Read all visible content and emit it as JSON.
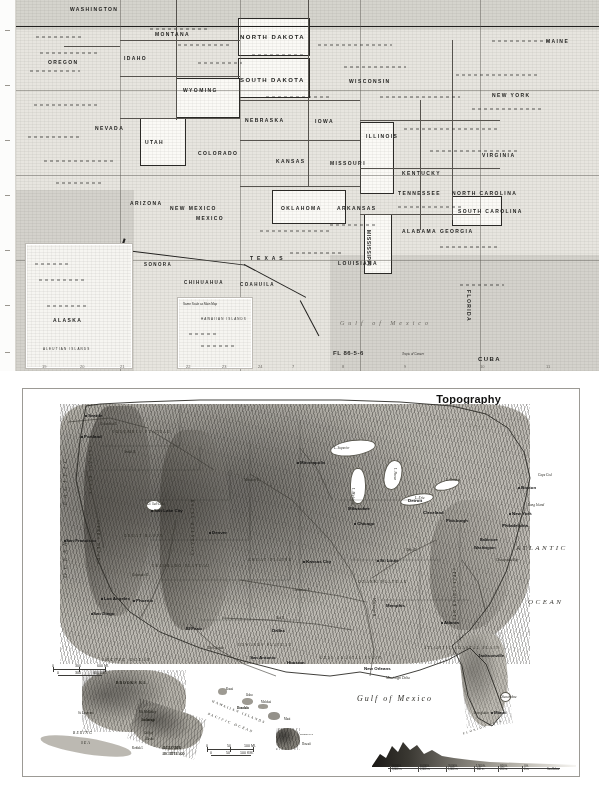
{
  "page": {
    "kind": "scanned-atlas-page",
    "background_color": "#ffffff"
  },
  "top_map": {
    "name": "united-states-reference-map",
    "plate_number": "FL 86-5-6",
    "paper_color": "#e7e5df",
    "states": [
      {
        "label": "WASHINGTON",
        "x": 70,
        "y": 6
      },
      {
        "label": "OREGON",
        "x": 48,
        "y": 59
      },
      {
        "label": "MONTANA",
        "x": 155,
        "y": 31
      },
      {
        "label": "NORTH DAKOTA",
        "x": 240,
        "y": 34
      },
      {
        "label": "SOUTH DAKOTA",
        "x": 240,
        "y": 77
      },
      {
        "label": "IDAHO",
        "x": 124,
        "y": 55
      },
      {
        "label": "WYOMING",
        "x": 183,
        "y": 87
      },
      {
        "label": "NEBRASKA",
        "x": 245,
        "y": 117
      },
      {
        "label": "NEVADA",
        "x": 95,
        "y": 125
      },
      {
        "label": "UTAH",
        "x": 145,
        "y": 139
      },
      {
        "label": "COLORADO",
        "x": 198,
        "y": 150
      },
      {
        "label": "KANSAS",
        "x": 276,
        "y": 158
      },
      {
        "label": "IOWA",
        "x": 315,
        "y": 118
      },
      {
        "label": "WISCONSIN",
        "x": 355,
        "y": 78
      },
      {
        "label": "ILLINOIS",
        "x": 370,
        "y": 133
      },
      {
        "label": "MISSOURI",
        "x": 330,
        "y": 160
      },
      {
        "label": "ARIZONA",
        "x": 130,
        "y": 200
      },
      {
        "label": "NEW MEXICO",
        "x": 185,
        "y": 205
      },
      {
        "label": "OKLAHOMA",
        "x": 285,
        "y": 205
      },
      {
        "label": "ARKANSAS",
        "x": 340,
        "y": 205
      },
      {
        "label": "TEXAS",
        "x": 250,
        "y": 255
      },
      {
        "label": "LOUISIANA",
        "x": 345,
        "y": 260
      },
      {
        "label": "MISSISSIPPI",
        "x": 375,
        "y": 230
      },
      {
        "label": "ALABAMA",
        "x": 408,
        "y": 228
      },
      {
        "label": "GEORGIA",
        "x": 445,
        "y": 228
      },
      {
        "label": "TENNESSEE",
        "x": 400,
        "y": 190
      },
      {
        "label": "KENTUCKY",
        "x": 405,
        "y": 170
      },
      {
        "label": "VIRGINIA",
        "x": 490,
        "y": 152
      },
      {
        "label": "NORTH CAROLINA",
        "x": 462,
        "y": 190
      },
      {
        "label": "SOUTH CAROLINA",
        "x": 468,
        "y": 208
      },
      {
        "label": "NEW YORK",
        "x": 495,
        "y": 92
      },
      {
        "label": "MAINE",
        "x": 548,
        "y": 38
      },
      {
        "label": "FLORIDA",
        "x": 470,
        "y": 290
      },
      {
        "label": "MEXICO",
        "x": 200,
        "y": 215
      },
      {
        "label": "SONORA",
        "x": 150,
        "y": 262
      },
      {
        "label": "CHIHUAHUA",
        "x": 190,
        "y": 280
      },
      {
        "label": "COAHUILA",
        "x": 245,
        "y": 282
      },
      {
        "label": "CUBA",
        "x": 480,
        "y": 358
      }
    ],
    "water_labels": [
      {
        "label": "Gulf of Mexico",
        "x": 340,
        "y": 320
      },
      {
        "label": "Tropic of Cancer",
        "x": 405,
        "y": 352
      }
    ],
    "insets": [
      {
        "name": "alaska-inset",
        "label": "ALASKA",
        "sublabel": "ALEUTIAN ISLANDS",
        "x": 26,
        "y": 244,
        "w": 104,
        "h": 122
      },
      {
        "name": "hawaii-inset",
        "label": "HAWAIIAN ISLANDS",
        "sublabel": "Same Scale as Main Map",
        "x": 178,
        "y": 298,
        "w": 72,
        "h": 68
      }
    ],
    "grid_numbers_bottom": [
      "19",
      "20",
      "21",
      "22",
      "23",
      "24",
      "7",
      "8",
      "9",
      "10",
      "11"
    ],
    "grid_numbers_left": [
      "A",
      "B",
      "C",
      "D",
      "E",
      "F",
      "G"
    ]
  },
  "bottom_map": {
    "name": "united-states-topography-map",
    "title": "Topography",
    "frame_color": "#9c9a95",
    "scale": {
      "miles": {
        "ticks": [
          "0",
          "200",
          "400 MI."
        ]
      },
      "km": {
        "ticks": [
          "0",
          "200",
          "400 KM."
        ]
      }
    },
    "oceans": [
      {
        "label": "PACIFIC",
        "x": 66,
        "y": 463
      },
      {
        "label": "OCEAN",
        "x": 69,
        "y": 540
      },
      {
        "label": "ATLANTIC",
        "x": 519,
        "y": 546
      },
      {
        "label": "OCEAN",
        "x": 529,
        "y": 600
      },
      {
        "label": "Gulf of Mexico",
        "x": 362,
        "y": 698
      }
    ],
    "cities": [
      {
        "label": "Seattle",
        "x": 88,
        "y": 415
      },
      {
        "label": "Portland",
        "x": 84,
        "y": 436
      },
      {
        "label": "San Francisco",
        "x": 70,
        "y": 540
      },
      {
        "label": "Los Angeles",
        "x": 108,
        "y": 598
      },
      {
        "label": "San Diego",
        "x": 97,
        "y": 613
      },
      {
        "label": "Salt Lake City",
        "x": 158,
        "y": 510
      },
      {
        "label": "Denver",
        "x": 215,
        "y": 532
      },
      {
        "label": "Phoenix",
        "x": 140,
        "y": 600
      },
      {
        "label": "El Paso",
        "x": 190,
        "y": 628
      },
      {
        "label": "Dallas",
        "x": 275,
        "y": 630
      },
      {
        "label": "Houston",
        "x": 290,
        "y": 662
      },
      {
        "label": "San Antonio",
        "x": 256,
        "y": 657
      },
      {
        "label": "Minneapolis",
        "x": 305,
        "y": 462
      },
      {
        "label": "Milwaukee",
        "x": 352,
        "y": 508
      },
      {
        "label": "Chicago",
        "x": 360,
        "y": 523
      },
      {
        "label": "Kansas City",
        "x": 312,
        "y": 561
      },
      {
        "label": "St. Louis",
        "x": 382,
        "y": 560
      },
      {
        "label": "Memphis",
        "x": 388,
        "y": 605
      },
      {
        "label": "New Orleans",
        "x": 370,
        "y": 668
      },
      {
        "label": "Detroit",
        "x": 410,
        "y": 500
      },
      {
        "label": "Cleveland",
        "x": 425,
        "y": 512
      },
      {
        "label": "Pittsburgh",
        "x": 448,
        "y": 520
      },
      {
        "label": "Atlanta",
        "x": 447,
        "y": 622
      },
      {
        "label": "Jacksonville",
        "x": 480,
        "y": 655
      },
      {
        "label": "Miami",
        "x": 496,
        "y": 712
      },
      {
        "label": "Boston",
        "x": 524,
        "y": 487
      },
      {
        "label": "New York",
        "x": 514,
        "y": 513
      },
      {
        "label": "Philadelphia",
        "x": 505,
        "y": 525
      },
      {
        "label": "Baltimore",
        "x": 484,
        "y": 540
      },
      {
        "label": "Washington",
        "x": 482,
        "y": 548
      }
    ],
    "physical_features": [
      {
        "label": "COLUMBIA PLATEAU",
        "x": 120,
        "y": 432
      },
      {
        "label": "CASCADE RANGE",
        "x": 92,
        "y": 448
      },
      {
        "label": "GREAT BASIN",
        "x": 130,
        "y": 536
      },
      {
        "label": "SIERRA NEVADA",
        "x": 98,
        "y": 528
      },
      {
        "label": "COLORADO PLATEAU",
        "x": 160,
        "y": 566
      },
      {
        "label": "ROCKY MOUNTAINS",
        "x": 198,
        "y": 505
      },
      {
        "label": "GREAT PLAINS",
        "x": 256,
        "y": 560
      },
      {
        "label": "OZARK PLATEAU",
        "x": 365,
        "y": 582
      },
      {
        "label": "APPALACHIAN MTS.",
        "x": 458,
        "y": 570
      },
      {
        "label": "ATLANTIC COASTAL PLAIN",
        "x": 436,
        "y": 648
      },
      {
        "label": "GULF COASTAL PLAIN",
        "x": 330,
        "y": 658
      },
      {
        "label": "EDWARDS PLATEAU",
        "x": 246,
        "y": 645
      },
      {
        "label": "FLORIDA KEYS",
        "x": 470,
        "y": 727
      },
      {
        "label": "Everglades",
        "x": 478,
        "y": 713
      },
      {
        "label": "Mississippi Delta",
        "x": 392,
        "y": 678
      },
      {
        "label": "Long Island",
        "x": 532,
        "y": 505
      },
      {
        "label": "Cape Cod",
        "x": 542,
        "y": 475
      },
      {
        "label": "Chesapeake Bay",
        "x": 500,
        "y": 560
      },
      {
        "label": "Okeechobee",
        "x": 503,
        "y": 697
      }
    ],
    "rivers": [
      {
        "label": "Columbia R.",
        "x": 104,
        "y": 424
      },
      {
        "label": "Snake R.",
        "x": 128,
        "y": 452
      },
      {
        "label": "Missouri R.",
        "x": 250,
        "y": 480
      },
      {
        "label": "Mississippi R.",
        "x": 378,
        "y": 600
      },
      {
        "label": "Ohio R.",
        "x": 410,
        "y": 550
      },
      {
        "label": "Arkansas R.",
        "x": 300,
        "y": 590
      },
      {
        "label": "Red R.",
        "x": 280,
        "y": 618
      },
      {
        "label": "Rio Grande",
        "x": 214,
        "y": 648
      },
      {
        "label": "Colorado R.",
        "x": 138,
        "y": 575
      },
      {
        "label": "Gt. Salt Lake",
        "x": 152,
        "y": 504
      },
      {
        "label": "L. Superior",
        "x": 340,
        "y": 448
      },
      {
        "label": "L. Michigan",
        "x": 356,
        "y": 490
      },
      {
        "label": "L. Huron",
        "x": 398,
        "y": 470
      },
      {
        "label": "L. Erie",
        "x": 420,
        "y": 498
      },
      {
        "label": "L. Ontario",
        "x": 450,
        "y": 480
      }
    ],
    "alaska_inset": {
      "name": "alaska-inset",
      "labels": [
        {
          "label": "ARCTIC OCEAN",
          "x": 104,
          "y": 661
        },
        {
          "label": "BROOKS RA.",
          "x": 118,
          "y": 683
        },
        {
          "label": "BERING",
          "x": 74,
          "y": 733
        },
        {
          "label": "SEA",
          "x": 82,
          "y": 743
        },
        {
          "label": "Gulf of",
          "x": 145,
          "y": 733
        },
        {
          "label": "Alaska",
          "x": 146,
          "y": 739
        },
        {
          "label": "Kodiak I.",
          "x": 134,
          "y": 748
        },
        {
          "label": "ALEXANDER",
          "x": 163,
          "y": 748
        },
        {
          "label": "ARCHIPELAGO",
          "x": 163,
          "y": 754
        },
        {
          "label": "St. Lawrence",
          "x": 79,
          "y": 713
        },
        {
          "label": "Mt. McKinley",
          "x": 140,
          "y": 712
        },
        {
          "label": "Anchorage",
          "x": 142,
          "y": 720
        }
      ],
      "scale": {
        "miles": [
          "0",
          "300",
          "600 MI."
        ],
        "km": [
          "0",
          "300",
          "600 KM."
        ]
      }
    },
    "hawaii_inset": {
      "name": "hawaii-inset",
      "labels": [
        {
          "label": "HAWAIIAN ISLANDS",
          "x": 213,
          "y": 712
        },
        {
          "label": "PACIFIC OCEAN",
          "x": 208,
          "y": 722
        },
        {
          "label": "Kauai",
          "x": 222,
          "y": 692
        },
        {
          "label": "Oahu",
          "x": 250,
          "y": 703
        },
        {
          "label": "Honolulu",
          "x": 243,
          "y": 712
        },
        {
          "label": "Molokai",
          "x": 263,
          "y": 711
        },
        {
          "label": "Maui",
          "x": 284,
          "y": 723
        },
        {
          "label": "Hawaii",
          "x": 300,
          "y": 745
        },
        {
          "label": "Mauna Kea",
          "x": 303,
          "y": 738
        }
      ],
      "scale": {
        "miles": [
          "0",
          "50",
          "100 MI."
        ],
        "km": [
          "0",
          "50",
          "100 KM."
        ]
      }
    },
    "elevation_legend": {
      "name": "elevation-legend",
      "steps": [
        {
          "feet": "9,000 ft.",
          "meters": "3,000 m."
        },
        {
          "feet": "6,000 ft.",
          "meters": "2,000 m."
        },
        {
          "feet": "3,000 ft.",
          "meters": "1,000 m."
        },
        {
          "feet": "1,500 ft.",
          "meters": "500 m."
        },
        {
          "feet": "600 ft.",
          "meters": "200 m."
        },
        {
          "feet": "0 ft.",
          "meters": "0 m."
        },
        {
          "feet": "Sea",
          "meters": "Below"
        }
      ]
    }
  }
}
